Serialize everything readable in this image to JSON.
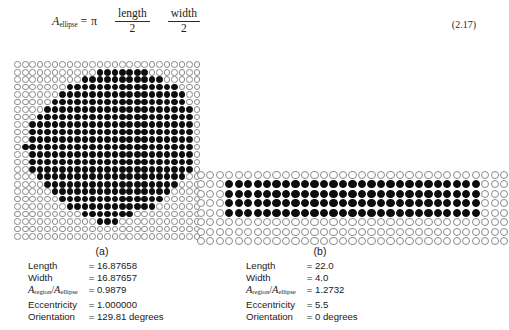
{
  "equation": {
    "lhs_var": "A",
    "lhs_sub": "ellipse",
    "equals": "=",
    "pi": "π",
    "frac1_num": "length",
    "frac1_den": "2",
    "frac2_num": "width",
    "frac2_den": "2",
    "number": "(2.17)"
  },
  "panels": [
    {
      "caption": "(a)",
      "stats": [
        {
          "label": "Length",
          "value": "= 16.87658",
          "is_ratio": false
        },
        {
          "label": "Width",
          "value": "= 16.87657",
          "is_ratio": false
        },
        {
          "label": "Aregion/Aellipse",
          "value": "= 0.9879",
          "is_ratio": true,
          "ratio": {
            "var1": "A",
            "sub1": "region",
            "slash": "/",
            "var2": "A",
            "sub2": "ellipse"
          }
        },
        {
          "label": "Eccentricity",
          "value": "= 1.000000",
          "is_ratio": false
        },
        {
          "label": "Orientation",
          "value": "= 129.81 degrees",
          "is_ratio": false
        }
      ]
    },
    {
      "caption": "(b)",
      "stats": [
        {
          "label": "Length",
          "value": "= 22.0",
          "is_ratio": false
        },
        {
          "label": "Width",
          "value": "= 4.0",
          "is_ratio": false
        },
        {
          "label": "Aregion/Aellipse",
          "value": "= 1.2732",
          "is_ratio": true,
          "ratio": {
            "var1": "A",
            "sub1": "region",
            "slash": "/",
            "var2": "A",
            "sub2": "ellipse"
          }
        },
        {
          "label": "Eccentricity",
          "value": "= 5.5",
          "is_ratio": false
        },
        {
          "label": "Orientation",
          "value": "= 0 degrees",
          "is_ratio": false
        }
      ]
    }
  ],
  "colors": {
    "dot_on": "#0d0d0d",
    "dot_off_border": "#8a8a8a",
    "dot_off_fill": "#ffffff",
    "text": "#1a1a1a"
  },
  "grid_a": {
    "name": "disk-shaped-region-dot-grid",
    "rows": 24,
    "cols": 25,
    "filled_row_spans": [
      [],
      [
        11,
        17
      ],
      [
        9,
        19
      ],
      [
        7,
        21
      ],
      [
        6,
        22
      ],
      [
        5,
        22
      ],
      [
        4,
        23
      ],
      [
        3,
        23
      ],
      [
        2,
        23
      ],
      [
        2,
        23
      ],
      [
        2,
        23
      ],
      [
        1,
        23
      ],
      [
        2,
        23
      ],
      [
        2,
        23
      ],
      [
        2,
        23
      ],
      [
        3,
        22
      ],
      [
        4,
        21
      ],
      [
        5,
        20
      ],
      [
        6,
        19
      ],
      [
        7,
        18
      ],
      [
        9,
        15
      ],
      [
        11,
        13
      ],
      [],
      []
    ]
  },
  "grid_b": {
    "name": "elongated-region-dot-grid",
    "rows": 8,
    "cols": 33,
    "filled_row_spans": [
      [],
      [
        3,
        29
      ],
      [
        3,
        29
      ],
      [
        3,
        29
      ],
      [
        3,
        29
      ],
      [],
      [],
      []
    ]
  }
}
